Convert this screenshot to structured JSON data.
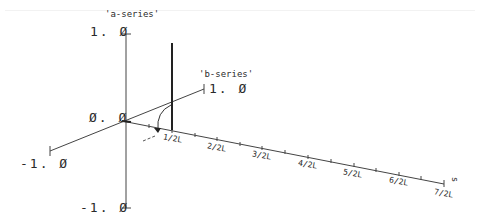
{
  "diagram": {
    "axes": {
      "a_axis": {
        "label": "'a-series'",
        "max_label": "1. Ø",
        "min_label": "-1. Ø"
      },
      "b_axis": {
        "label": "'b-series'",
        "max_label": "1. Ø",
        "min_label": "-1. Ø"
      },
      "origin_label": "Ø. Ø",
      "z_axis": {
        "label": "s",
        "ticks": [
          "1/2L",
          "2/2L",
          "3/2L",
          "4/2L",
          "5/2L",
          "6/2L",
          "7/2L"
        ]
      }
    },
    "colors": {
      "line": "#333333",
      "text": "#2a2a2a",
      "background": "#ffffff"
    }
  }
}
